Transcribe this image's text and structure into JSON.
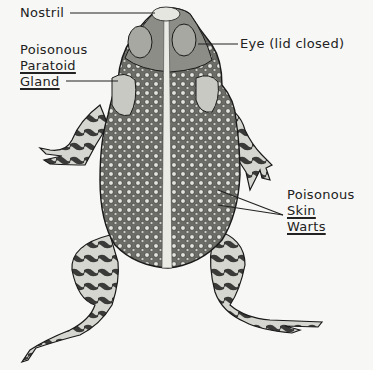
{
  "figure": {
    "labels": {
      "nostril": "Nostril",
      "eye": "Eye (lid closed)",
      "paratoid_line1": "Poisonous",
      "paratoid_line2": "Paratoid",
      "paratoid_line3": "Gland",
      "warts_line1": "Poisonous",
      "warts_line2": "Skin",
      "warts_line3": "Warts"
    },
    "colors": {
      "background": "#f7f7f5",
      "ink": "#1a1a1a",
      "skin_light": "#d9d9d4",
      "skin_mid": "#8a8a85",
      "skin_dark": "#2b2b2b"
    }
  }
}
